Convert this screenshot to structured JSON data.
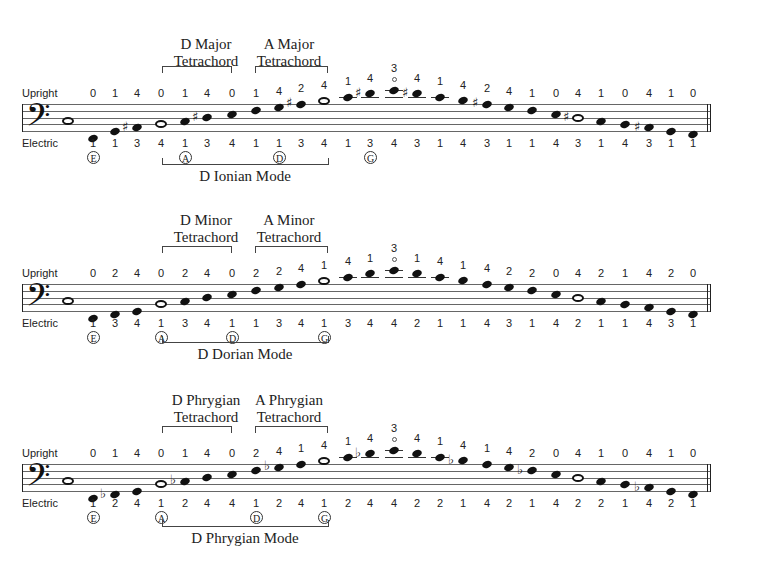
{
  "row_labels": {
    "upright": "Upright",
    "electric": "Electric"
  },
  "systems": [
    {
      "id": "ionian",
      "tetrachord1": "D Major\nTetrachord",
      "tetrachord1_lines": [
        "D Major",
        "Tetrachord"
      ],
      "tetrachord2_lines": [
        "A Major",
        "Tetrachord"
      ],
      "mode": "D Ionian Mode",
      "strings": [
        "E",
        "A",
        "D",
        "G"
      ],
      "upright": [
        "0",
        "1",
        "4",
        "0",
        "1",
        "4",
        "0",
        "1",
        "4",
        "2",
        "4",
        "1",
        "4",
        "3",
        "4",
        "1",
        "4",
        "2",
        "4",
        "1",
        "0",
        "4",
        "1",
        "0",
        "4",
        "1",
        "0"
      ],
      "electric": [
        "1",
        "1",
        "3",
        "4",
        "1",
        "3",
        "4",
        "1",
        "1",
        "3",
        "4",
        "1",
        "3",
        "4",
        "3",
        "1",
        "4",
        "3",
        "1",
        "1",
        "4",
        "3",
        "1",
        "4",
        "3",
        "1",
        "1"
      ],
      "notes": [
        "D",
        "F#",
        "G",
        "A",
        "B",
        "C#",
        "D",
        "E",
        "F#",
        "G",
        "A",
        "B",
        "C#",
        "D",
        "C#",
        "B",
        "A",
        "G",
        "F#",
        "E",
        "D",
        "C#",
        "B",
        "A",
        "G",
        "F#",
        "E"
      ]
    },
    {
      "id": "dorian",
      "tetrachord1_lines": [
        "D Minor",
        "Tetrachord"
      ],
      "tetrachord2_lines": [
        "A Minor",
        "Tetrachord"
      ],
      "mode": "D Dorian Mode",
      "strings": [
        "E",
        "A",
        "D",
        "G"
      ],
      "upright": [
        "0",
        "2",
        "4",
        "0",
        "2",
        "4",
        "0",
        "2",
        "2",
        "4",
        "1",
        "4",
        "1",
        "3",
        "1",
        "4",
        "1",
        "4",
        "2",
        "2",
        "0",
        "4",
        "2",
        "1",
        "4",
        "2",
        "0"
      ],
      "electric": [
        "1",
        "3",
        "4",
        "1",
        "3",
        "4",
        "1",
        "1",
        "3",
        "4",
        "1",
        "3",
        "4",
        "4",
        "2",
        "1",
        "1",
        "4",
        "3",
        "1",
        "4",
        "2",
        "1",
        "1",
        "4",
        "3",
        "1"
      ]
    },
    {
      "id": "phrygian",
      "tetrachord1_lines": [
        "D Phrygian",
        "Tetrachord"
      ],
      "tetrachord2_lines": [
        "A Phrygian",
        "Tetrachord"
      ],
      "mode": "D Phrygian Mode",
      "strings": [
        "E",
        "A",
        "D",
        "G"
      ],
      "upright": [
        "0",
        "1",
        "4",
        "0",
        "1",
        "4",
        "0",
        "2",
        "4",
        "1",
        "4",
        "1",
        "4",
        "3",
        "4",
        "1",
        "4",
        "1",
        "4",
        "2",
        "0",
        "4",
        "1",
        "0",
        "4",
        "1",
        "0"
      ],
      "electric": [
        "1",
        "2",
        "4",
        "1",
        "2",
        "4",
        "4",
        "1",
        "2",
        "4",
        "1",
        "2",
        "4",
        "4",
        "2",
        "2",
        "1",
        "4",
        "2",
        "1",
        "4",
        "2",
        "2",
        "1",
        "4",
        "2",
        "1"
      ]
    }
  ]
}
